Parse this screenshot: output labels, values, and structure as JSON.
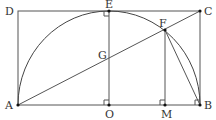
{
  "diagram": {
    "points": {
      "A": {
        "label": "A",
        "x": 18,
        "y": 105
      },
      "B": {
        "label": "B",
        "x": 200,
        "y": 105
      },
      "C": {
        "label": "C",
        "x": 200,
        "y": 11
      },
      "D": {
        "label": "D",
        "x": 18,
        "y": 11
      },
      "E": {
        "label": "E",
        "x": 109,
        "y": 11
      },
      "F": {
        "label": "F",
        "x": 165,
        "y": 30
      },
      "G": {
        "label": "G",
        "x": 109,
        "y": 55
      },
      "O": {
        "label": "O",
        "x": 109,
        "y": 105
      },
      "M": {
        "label": "M",
        "x": 165,
        "y": 105
      }
    },
    "segments": [
      "AB",
      "BC",
      "CD",
      "DA",
      "AC",
      "EO",
      "FM",
      "FB"
    ],
    "arcs": [
      "semicircle centered at O through A, E, F, B"
    ],
    "right_angles": [
      "O",
      "M",
      "B",
      "E"
    ],
    "colors": {
      "line": "#555555",
      "label": "#333333",
      "background": "#ffffff"
    }
  }
}
